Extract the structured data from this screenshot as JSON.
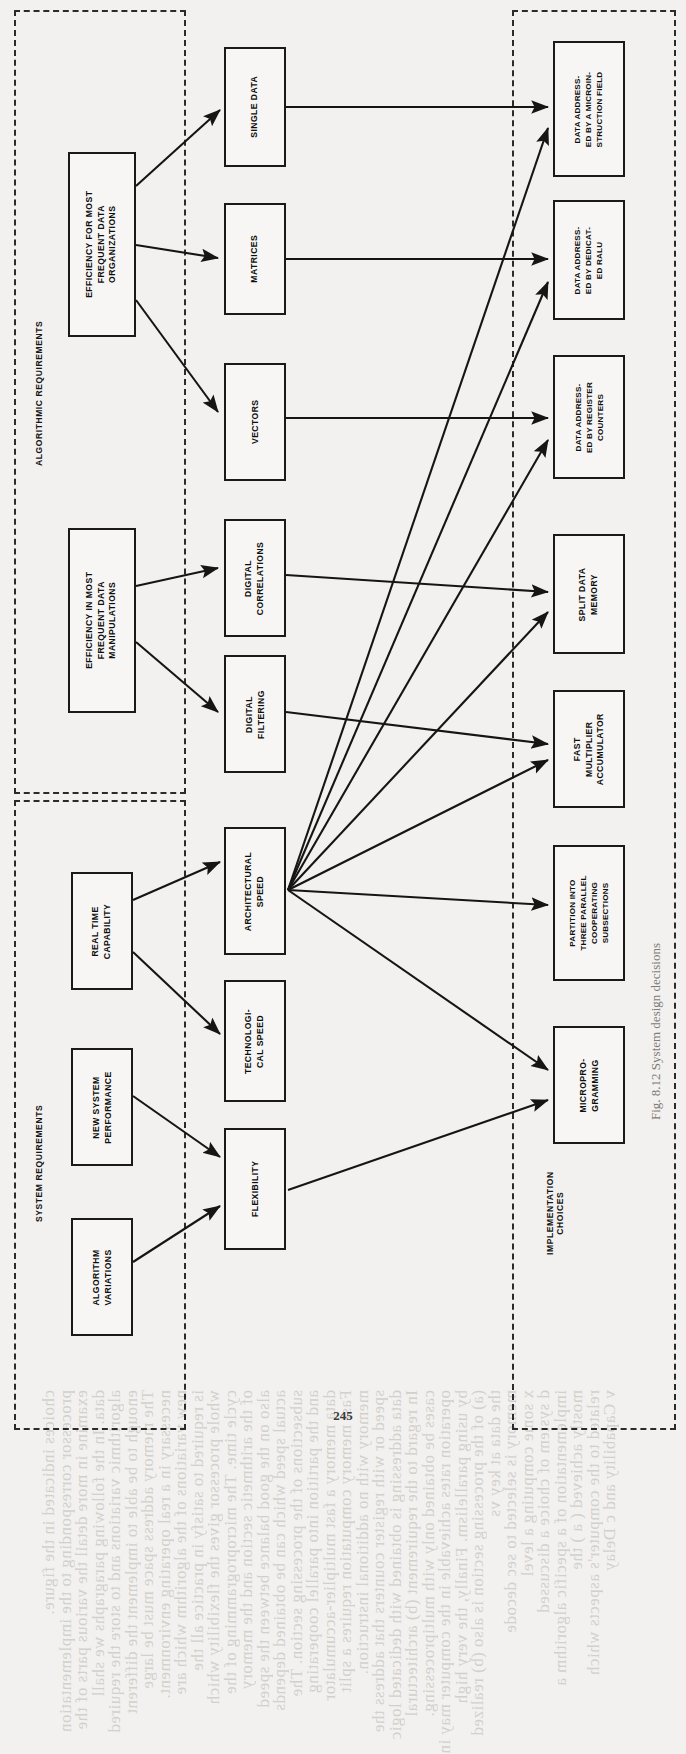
{
  "figure": {
    "page_number": "245",
    "caption": "Fig. 8.12  System design decisions"
  },
  "groups": [
    {
      "id": "algorithmic",
      "label": "ALGORITHMIC REQUIREMENTS"
    },
    {
      "id": "system",
      "label": "SYSTEM REQUIREMENTS"
    },
    {
      "id": "implementation",
      "label": "IMPLEMENTATION\nCHOICES"
    }
  ],
  "nodes": {
    "efficiency_organizations": "EFFICIENCY FOR MOST\nFREQUENT DATA\nORGANIZATIONS",
    "efficiency_manipulations": "EFFICIENCY IN MOST\nFREQUENT DATA\nMANIPULATIONS",
    "real_time_capability": "REAL TIME\nCAPABILITY",
    "new_system_performance": "NEW SYSTEM\nPERFORMANCE",
    "algorithm_variations": "ALGORITHM\nVARIATIONS",
    "single_data": "SINGLE DATA",
    "matrices": "MATRICES",
    "vectors": "VECTORS",
    "digital_correlations": "DIGITAL\nCORRELATIONS",
    "digital_filtering": "DIGITAL\nFILTERING",
    "architectural_speed": "ARCHITECTURAL\nSPEED",
    "technological_speed": "TECHNOLOGI-\nCAL SPEED",
    "flexibility": "FLEXIBILITY",
    "data_addressed_microinstruction": "DATA ADDRESS-\nED BY A MICROIN-\nSTRUCTION FIELD",
    "data_addressed_dedicated_ralu": "DATA ADDRESS-\nED BY DEDICAT-\nED RALU",
    "data_addressed_register_counters": "DATA ADDRESS-\nED BY REGISTER\nCOUNTERS",
    "split_data_memory": "SPLIT DATA\nMEMORY",
    "fast_multiplier_accumulator": "FAST\nMULTIPLIER\nACCUMULATOR",
    "partition_three_parallel": "PARTITION INTO\nTHREE PARALLEL\nCOOPERATING\nSUBSECTIONS",
    "microprogramming": "MICROPRO-\nGRAMMING"
  },
  "bleed_text": [
    "v Capability and  c Delay",
    "related to the computer's aspects  which",
    "mostly achieved  ( a  )  the",
    "implementation of a  specific  algorithm a",
    "d system of choice  a  discussed",
    "x  some computing  a  level",
    "memory is selected  to  sec  decode",
    "the  data  at  key  vs",
    "(a) of the  processing section  is  also  (b) realized",
    "by  using  parallelism.  Finally,  the  very  high",
    "operation rates achievable  in  the  computer  may  in",
    "cases  be  obtained  only  with  multiprocessing.",
    "In regard  to  the  requirement  (b)  architectural",
    "data  addressing  is  obtained  with  dedicated  logic",
    "speed  or  with  register  counters  that  address  the",
    "memory  with  no  additional  instruction.",
    "Fast  memory  computation  requires  a  split",
    "data  memory  a  fast  multiplier-accumulator",
    "and  the  partition  into  parallel  cooperating",
    "subsections  of  the  processing  section.  The",
    "actual  speed  which  can  be  obtained  depends",
    "also  on  the  good  balance  between  the  speed",
    "of  the  arithmetic  section  and  the  memory",
    "cycle  time.  The  microprogramming  of  the",
    "whole  processor  gives  the  flexibility  which",
    "is  required  to  satisfy  in  practice  all  the",
    "new  variations  of  the  algorithm  which  are",
    "necessary  in  a  real  operating  environment.",
    "The  memory  address  space  must  be  large",
    "enough  to  be  able  to  implement  the  different",
    "algorithmic  variations  and  to  store  the  required",
    "data.  In  the  following  paragraphs  we  shall",
    "examine  in  more  detail  the  various  parts  of  the",
    "processor  corresponding  to  the  implementation",
    "choices  indicated  in  the  figure."
  ]
}
